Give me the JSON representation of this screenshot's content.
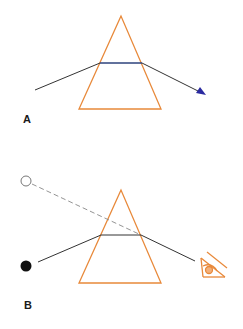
{
  "panels": [
    {
      "id": "A",
      "label": "A",
      "description": "Light ray refracting through a prism and exiting with arrow"
    },
    {
      "id": "B",
      "label": "B",
      "description": "Observer sees object displaced: real object (filled circle) appears at virtual position (open circle)"
    }
  ],
  "colors": {
    "prism": "#e8893a",
    "ray": "#333333",
    "arrow": "#2a2aa0",
    "dashed_ray": "#888888",
    "eye": "#e8893a"
  },
  "icons": {
    "eye": "eye-icon",
    "real_object": "filled-circle",
    "virtual_image": "open-circle"
  }
}
